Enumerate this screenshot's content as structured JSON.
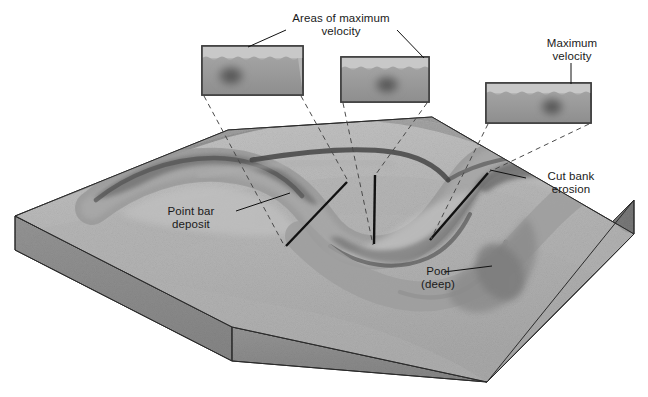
{
  "figure": {
    "background_color": "#ffffff",
    "text_color": "#1a1a1a"
  },
  "labels": {
    "areas_of_maximum_velocity": {
      "line1": "Areas of maximum",
      "line2": "velocity"
    },
    "maximum_velocity": {
      "line1": "Maximum",
      "line2": "velocity"
    },
    "point_bar_deposit": {
      "line1": "Point bar",
      "line2": "deposit"
    },
    "cut_bank_erosion": {
      "line1": "Cut bank",
      "line2": "erosion"
    },
    "pool_deep": {
      "line1": "Pool",
      "line2": "(deep)"
    }
  },
  "insets": [
    {
      "name": "cross-section-upstream",
      "velocity_core_position": "left",
      "description": "Channel cross section with maximum velocity core near the left (outer) bank"
    },
    {
      "name": "cross-section-midstream",
      "velocity_core_position": "center",
      "description": "Channel cross section with maximum velocity core near the center"
    },
    {
      "name": "cross-section-downstream",
      "velocity_core_position": "right",
      "description": "Channel cross section with maximum velocity core near the right (outer) bank"
    }
  ],
  "colors": {
    "block_top": "#b9b9b9",
    "block_front": "#8e8e8e",
    "block_side": "#7e7e7e",
    "water": "#9a9a9a",
    "water_dark": "#6a6a6a",
    "velocity_core": "#5a5a5a",
    "inset_sky": "#c2c2c2",
    "inset_border": "#4a4a4a",
    "outline": "#2b2b2b",
    "leader_line": "#2b2b2b",
    "dashed_line": "#555555"
  }
}
